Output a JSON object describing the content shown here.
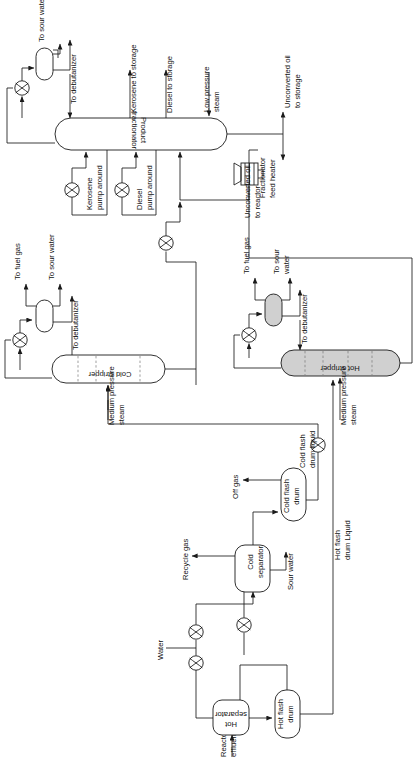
{
  "diagram": {
    "orientation": "rotated-90",
    "equipment": [
      {
        "id": "product-fractionator",
        "label": "Product\nfractionator",
        "type": "column",
        "filled": false
      },
      {
        "id": "cold-stripper",
        "label": "Cold stripper",
        "type": "column",
        "filled": false
      },
      {
        "id": "hot-stripper",
        "label": "Hot stripper",
        "type": "column",
        "filled": true
      },
      {
        "id": "hot-separator",
        "label": "Hot\nseparator",
        "type": "drum",
        "filled": false
      },
      {
        "id": "cold-separator",
        "label": "Cold\nseparator",
        "type": "drum",
        "filled": false
      },
      {
        "id": "hot-flash-drum",
        "label": "Hot flash\ndrum",
        "type": "drum",
        "filled": false
      },
      {
        "id": "cold-flash-drum",
        "label": "Cold flash\ndrum",
        "type": "drum",
        "filled": false
      },
      {
        "id": "fractionator-feed-heater",
        "label": "Fractionator\nfeed heater",
        "type": "fired-heater",
        "filled": false
      }
    ],
    "labels": {
      "to_sour_water_1": "To sour water",
      "to_debutanizer_1": "To debutanizer",
      "kerosene_to_storage": "Kerosene to storage",
      "diesel_to_storage": "Diesel to storage",
      "low_pressure_steam": "Low pressure\nsteam",
      "unconverted_oil_to_storage": "Unconverted oil\nto storage",
      "unconverted_oil_to_reactor": "Unconverted oil\nto reactor",
      "product_fractionator": "Product\nfractionator",
      "kerosene_pump_around": "Kerosene\npump around",
      "diesel_pump_around": "Diesel\npump around",
      "fractionator_feed_heater": "Fractionator\nfeed heater",
      "to_fuel_gas_cold": "To fuel gas",
      "to_sour_water_cold": "To sour water",
      "to_debutanizer_cold": "To debutanizer",
      "medium_pressure_steam_cold": "Medium pressure\nsteam",
      "cold_stripper": "Cold stripper",
      "to_fuel_gas_hot": "To fuel gas",
      "to_sour_water_hot": "To sour\nwater",
      "to_debutanizer_hot": "To debutanizer",
      "medium_pressure_steam_hot": "Medium pressure\nsteam",
      "hot_stripper": "Hot stripper",
      "cold_flash_drum_liquid": "Cold flash\ndrum liquid",
      "off_gas": "Off gas",
      "cold_flash_drum": "Cold flash\ndrum",
      "recycle_gas": "Recycle gas",
      "cold_separator": "Cold\nseparator",
      "sour_water": "Sour water",
      "water": "Water",
      "hot_flash_drum_liquid": "Hot flash\ndrum Liquid",
      "hot_flash_drum": "Hot flash\ndrum",
      "hot_separator": "Hot\nseparator",
      "reactor_effluent": "Reactor\neffluent"
    },
    "colors": {
      "line": "#1a1a1a",
      "text": "#111111",
      "vessel_fill": "#ffffff",
      "vessel_fill_highlight": "#d0d0d0",
      "tray": "#777777",
      "background": "#ffffff"
    }
  }
}
